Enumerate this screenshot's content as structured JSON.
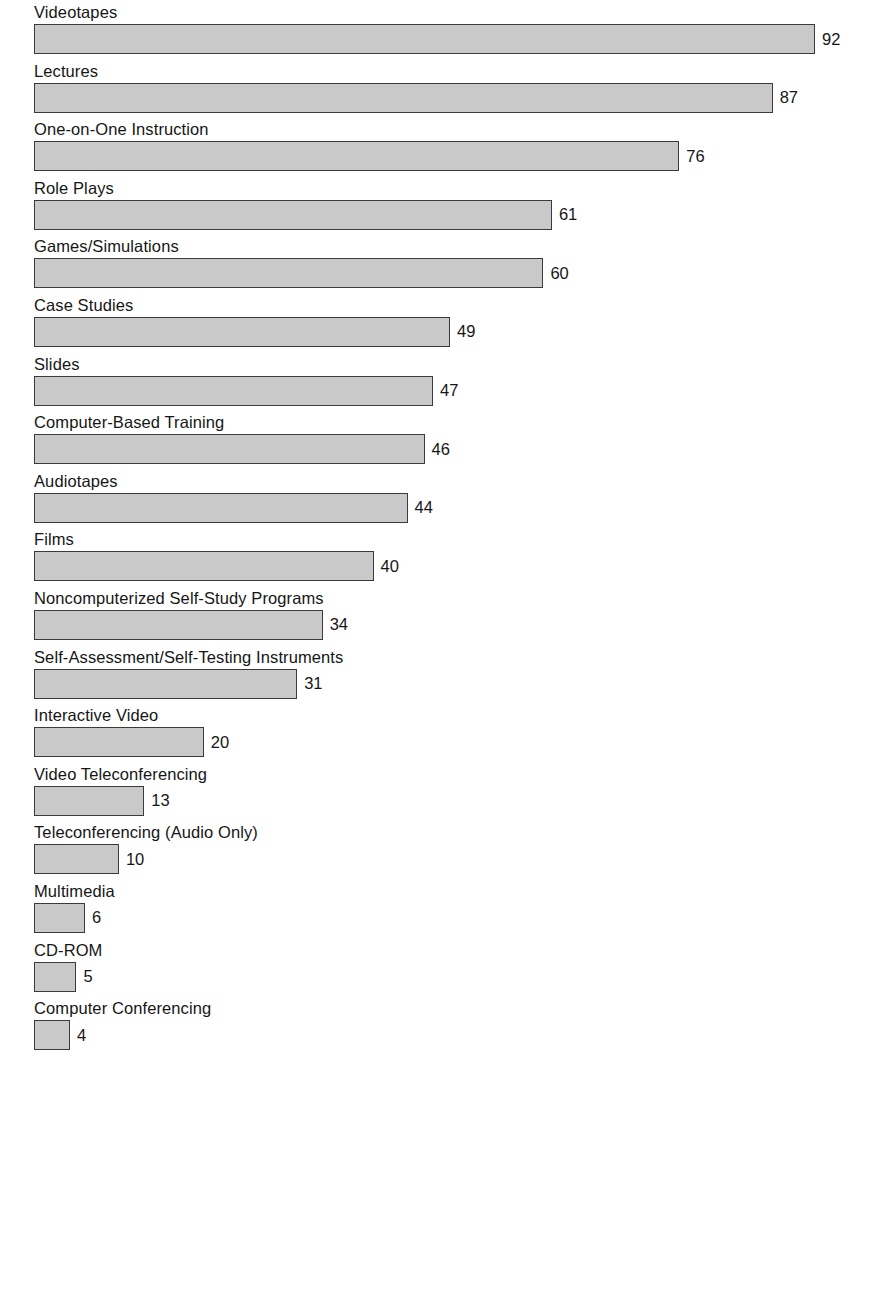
{
  "chart_data": {
    "type": "bar",
    "orientation": "horizontal",
    "title": "",
    "subtitle": "",
    "xlabel": "",
    "ylabel": "",
    "xlim": [
      0,
      92
    ],
    "grid": false,
    "legend": null,
    "value_labels": true,
    "categories": [
      "Videotapes",
      "Lectures",
      "One-on-One Instruction",
      "Role Plays",
      "Games/Simulations",
      "Case Studies",
      "Slides",
      "Computer-Based Training",
      "Audiotapes",
      "Films",
      "Noncomputerized Self-Study Programs",
      "Self-Assessment/Self-Testing Instruments",
      "Interactive Video",
      "Video Teleconferencing",
      "Teleconferencing (Audio Only)",
      "Multimedia",
      "CD-ROM",
      "Computer Conferencing"
    ],
    "values": [
      92,
      87,
      76,
      61,
      60,
      49,
      47,
      46,
      44,
      40,
      34,
      31,
      20,
      13,
      10,
      6,
      5,
      4
    ],
    "bars": [
      {
        "label": "Videotapes",
        "value": 92,
        "value_text": "92"
      },
      {
        "label": "Lectures",
        "value": 87,
        "value_text": "87"
      },
      {
        "label": "One-on-One Instruction",
        "value": 76,
        "value_text": "76"
      },
      {
        "label": "Role Plays",
        "value": 61,
        "value_text": "61"
      },
      {
        "label": "Games/Simulations",
        "value": 60,
        "value_text": "60"
      },
      {
        "label": "Case Studies",
        "value": 49,
        "value_text": "49"
      },
      {
        "label": "Slides",
        "value": 47,
        "value_text": "47"
      },
      {
        "label": "Computer-Based Training",
        "value": 46,
        "value_text": "46"
      },
      {
        "label": "Audiotapes",
        "value": 44,
        "value_text": "44"
      },
      {
        "label": "Films",
        "value": 40,
        "value_text": "40"
      },
      {
        "label": "Noncomputerized Self-Study Programs",
        "value": 34,
        "value_text": "34"
      },
      {
        "label": "Self-Assessment/Self-Testing Instruments",
        "value": 31,
        "value_text": "31"
      },
      {
        "label": "Interactive Video",
        "value": 20,
        "value_text": "20"
      },
      {
        "label": "Video Teleconferencing",
        "value": 13,
        "value_text": "13"
      },
      {
        "label": "Teleconferencing (Audio Only)",
        "value": 10,
        "value_text": "10"
      },
      {
        "label": "Multimedia",
        "value": 6,
        "value_text": "6"
      },
      {
        "label": "CD-ROM",
        "value": 5,
        "value_text": "5"
      },
      {
        "label": "Computer Conferencing",
        "value": 4,
        "value_text": "4"
      }
    ],
    "colors": {
      "bar_fill": "#c9c9c9",
      "bar_border": "#3a3a3a",
      "text": "#161616",
      "background": "#ffffff"
    }
  }
}
